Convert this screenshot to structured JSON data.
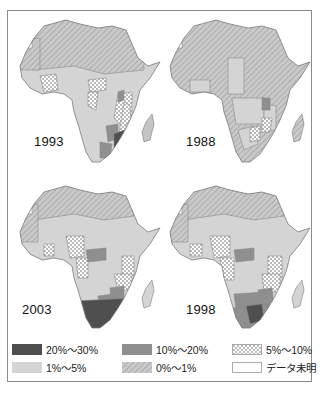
{
  "figure": {
    "panels": [
      {
        "year": "1993",
        "position": "top-left"
      },
      {
        "year": "1988",
        "position": "top-right"
      },
      {
        "year": "2003",
        "position": "bottom-left"
      },
      {
        "year": "1998",
        "position": "bottom-right"
      }
    ]
  },
  "legend": {
    "items": [
      {
        "label": "20%〜30%",
        "fill": "#4f4f4f",
        "pattern": "solid"
      },
      {
        "label": "10%〜20%",
        "fill": "#8f8f8f",
        "pattern": "solid"
      },
      {
        "label": "5%〜10%",
        "fill": "#ffffff",
        "pattern": "dots"
      },
      {
        "label": "1%〜5%",
        "fill": "#d4d4d4",
        "pattern": "solid"
      },
      {
        "label": "0%〜1%",
        "fill": "#c4c4c4",
        "pattern": "hatch"
      },
      {
        "label": "データ未明",
        "fill": "#ffffff",
        "pattern": "none"
      }
    ]
  },
  "colors": {
    "c20_30": "#4f4f4f",
    "c10_20": "#8f8f8f",
    "c1_5": "#d4d4d4",
    "c0_1": "#c4c4c4",
    "border": "#8a8a8a"
  }
}
